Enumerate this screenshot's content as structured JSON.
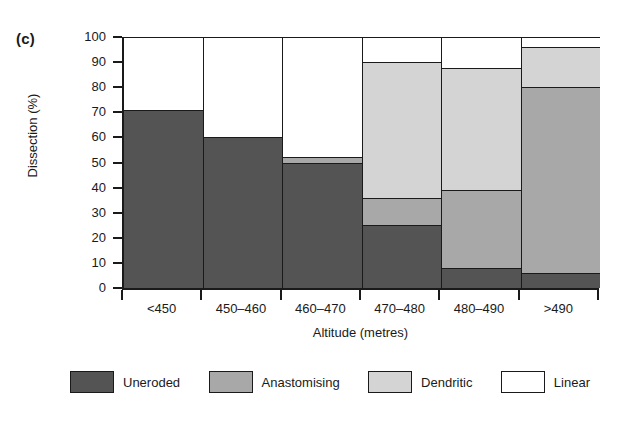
{
  "panel": {
    "label": "(c)"
  },
  "chart_data": {
    "type": "bar",
    "subtype": "stacked-bar-100",
    "title": "",
    "xlabel": "Altitude (metres)",
    "ylabel": "Dissection (%)",
    "ylim": [
      0,
      100
    ],
    "ytick_step": 10,
    "grid": false,
    "legend_position": "bottom",
    "categories": [
      "<450",
      "450–460",
      "460–470",
      "470–480",
      "480–490",
      ">490"
    ],
    "series": [
      {
        "name": "Uneroded",
        "color": "#545454",
        "values": [
          71,
          60,
          50,
          25,
          8,
          6
        ]
      },
      {
        "name": "Anastomising",
        "color": "#a8a8a8",
        "values": [
          0,
          0,
          2,
          11,
          31,
          74
        ]
      },
      {
        "name": "Dendritic",
        "color": "#d4d4d4",
        "values": [
          0,
          0,
          0,
          54,
          48.5,
          16
        ]
      },
      {
        "name": "Linear",
        "color": "#ffffff",
        "values": [
          29,
          40,
          48,
          10,
          12.5,
          4
        ]
      }
    ],
    "ytick_labels": [
      "0",
      "10",
      "20",
      "30",
      "40",
      "50",
      "60",
      "70",
      "80",
      "90",
      "100"
    ],
    "legend_entries": [
      "Uneroded",
      "Anastomising",
      "Dendritic",
      "Linear"
    ]
  }
}
